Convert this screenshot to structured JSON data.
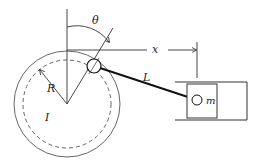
{
  "diagram": {
    "labels": {
      "theta": "θ",
      "x": "x",
      "L": "L",
      "R": "R",
      "I": "I",
      "m": "m"
    },
    "colors": {
      "stroke": "#333333",
      "rod": "#111111",
      "background": "#ffffff"
    }
  }
}
